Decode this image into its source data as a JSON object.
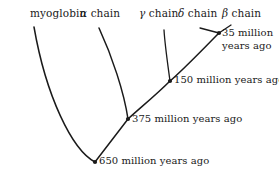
{
  "figure": {
    "type": "phylogenetic-tree",
    "title": "",
    "background_color": "#ffffff",
    "line_color": "#1a1a1a"
  },
  "tips": [
    {
      "id": "myoglobin",
      "label": "myoglobin",
      "greek": "",
      "suffix": "",
      "label_x": 30,
      "label_y": 8,
      "tip_x": 34,
      "tip_y": 27
    },
    {
      "id": "alpha",
      "label": "α chain",
      "greek": "α",
      "suffix": " chain",
      "label_x": 80,
      "label_y": 8,
      "tip_x": 99,
      "tip_y": 28
    },
    {
      "id": "gamma",
      "label": "γ chain",
      "greek": "γ",
      "suffix": " chain",
      "label_x": 139,
      "label_y": 8,
      "tip_x": 164,
      "tip_y": 30
    },
    {
      "id": "delta",
      "label": "δ chain",
      "greek": "δ",
      "suffix": " chain",
      "label_x": 178,
      "label_y": 8,
      "tip_x": 200,
      "tip_y": 28
    },
    {
      "id": "beta",
      "label": "β chain",
      "greek": "β",
      "suffix": " chain",
      "label_x": 222,
      "label_y": 8,
      "tip_x": 231,
      "tip_y": 25
    }
  ],
  "nodes": [
    {
      "id": "node-35",
      "age_text": "35 million",
      "age_text_line2": "years ago",
      "age_value": 35,
      "age_unit": "million years ago",
      "x": 219,
      "y": 33,
      "label_x": 222,
      "label_y": 27,
      "two_line": true
    },
    {
      "id": "node-150",
      "age_text": "150 million years ago",
      "age_text_line2": "",
      "age_value": 150,
      "age_unit": "million years ago",
      "x": 170,
      "y": 81,
      "label_x": 174,
      "label_y": 74,
      "two_line": false
    },
    {
      "id": "node-375",
      "age_text": "375 million years ago",
      "age_text_line2": "",
      "age_value": 375,
      "age_unit": "million years ago",
      "x": 128,
      "y": 119,
      "label_x": 132,
      "label_y": 113,
      "two_line": false
    },
    {
      "id": "node-650",
      "age_text": "650 million years ago",
      "age_text_line2": "",
      "age_value": 650,
      "age_unit": "million years ago",
      "x": 95,
      "y": 162,
      "label_x": 99,
      "label_y": 155,
      "two_line": false
    }
  ],
  "branches": [
    {
      "id": "branch-myoglobin",
      "from": "node-650",
      "to": "myoglobin",
      "path": "M 95 162 C 72 150 46 96 34 27"
    },
    {
      "id": "branch-650-375",
      "from": "node-650",
      "to": "node-375",
      "path": "M 95 162 L 128 119"
    },
    {
      "id": "branch-alpha",
      "from": "node-375",
      "to": "alpha",
      "path": "M 128 119 C 124 92 112 56 99 28"
    },
    {
      "id": "branch-375-150",
      "from": "node-375",
      "to": "node-150",
      "path": "M 128 119 C 140 108 156 95 170 81"
    },
    {
      "id": "branch-gamma",
      "from": "node-150",
      "to": "gamma",
      "path": "M 170 81 C 168 66 165 46 164 30"
    },
    {
      "id": "branch-150-35",
      "from": "node-150",
      "to": "node-35",
      "path": "M 170 81 C 184 69 204 48 219 33"
    },
    {
      "id": "branch-delta",
      "from": "node-35",
      "to": "delta",
      "path": "M 219 33 L 200 28"
    },
    {
      "id": "branch-beta",
      "from": "node-35",
      "to": "beta",
      "path": "M 219 33 L 231 25"
    }
  ],
  "style": {
    "branch_stroke_width": 1.5,
    "thin_stroke_width": 1.3,
    "node_dot_radius": 2.1
  }
}
